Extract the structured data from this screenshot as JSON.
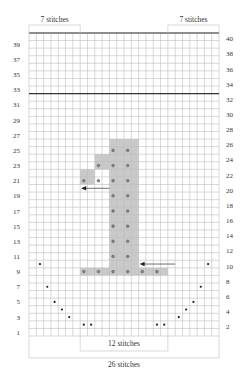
{
  "chart_data": {
    "type": "knitting-chart",
    "grid": {
      "columns": 26,
      "rows": 40,
      "left": 29,
      "top": 33,
      "cell_w": 7.31,
      "cell_h": 7.575
    },
    "colors": {
      "grid": "#bdbdbd",
      "thick_line": "#333333",
      "shade": "#c9c9c9",
      "dot": "#555555",
      "bracket": "#c8c8c8",
      "text": "#333333"
    },
    "thick_lines_after_row": [
      32,
      40
    ],
    "left_row_labels": [
      39,
      37,
      35,
      33,
      31,
      29,
      27,
      25,
      23,
      21,
      19,
      17,
      15,
      13,
      11,
      9,
      7,
      5,
      3,
      1
    ],
    "right_row_labels": [
      40,
      38,
      36,
      34,
      32,
      30,
      28,
      26,
      24,
      22,
      20,
      18,
      16,
      14,
      12,
      10,
      8,
      6,
      4,
      2
    ],
    "shaded_cells": [
      {
        "row_from": 9,
        "row_to": 9,
        "col_from": 8,
        "col_to": 19
      },
      {
        "row_from": 10,
        "row_to": 26,
        "col_from": 12,
        "col_to": 15
      },
      {
        "row_from": 23,
        "row_to": 24,
        "col_from": 10,
        "col_to": 11
      },
      {
        "row_from": 21,
        "row_to": 22,
        "col_from": 8,
        "col_to": 9
      }
    ],
    "ring_dots": [
      {
        "row": 25,
        "cols": [
          12,
          14
        ]
      },
      {
        "row": 23,
        "cols": [
          10,
          12,
          14
        ]
      },
      {
        "row": 21,
        "cols": [
          8,
          10,
          12,
          14
        ]
      },
      {
        "row": 19,
        "cols": [
          12,
          14
        ]
      },
      {
        "row": 17,
        "cols": [
          12,
          14
        ]
      },
      {
        "row": 15,
        "cols": [
          12,
          14
        ]
      },
      {
        "row": 13,
        "cols": [
          12,
          14
        ]
      },
      {
        "row": 11,
        "cols": [
          12,
          14
        ]
      },
      {
        "row": 9,
        "cols": [
          8,
          10,
          12,
          14,
          16,
          18
        ]
      }
    ],
    "small_dots": [
      {
        "row": 10,
        "cols": [
          2,
          25
        ]
      },
      {
        "row": 7,
        "cols": [
          3,
          24
        ]
      },
      {
        "row": 5,
        "cols": [
          4,
          23
        ]
      },
      {
        "row": 4,
        "cols": [
          5,
          22
        ]
      },
      {
        "row": 3,
        "cols": [
          6,
          21
        ]
      },
      {
        "row": 2,
        "cols": [
          8,
          9,
          18,
          19
        ]
      }
    ],
    "arrows": [
      {
        "row": 20,
        "from_col_edge": 12,
        "to_col_edge": 8,
        "direction": "left"
      },
      {
        "row": 10,
        "from_col_edge": 20,
        "to_col_edge": 16,
        "direction": "left"
      }
    ],
    "brackets": [
      {
        "position": "top",
        "col_from": 1,
        "col_to": 7,
        "label": "7 stitches"
      },
      {
        "position": "top",
        "col_from": 20,
        "col_to": 26,
        "label": "7 stitches"
      },
      {
        "position": "bottom",
        "col_from": 8,
        "col_to": 19,
        "label": "12 stitches",
        "depth": 20
      },
      {
        "position": "bottom",
        "col_from": 1,
        "col_to": 26,
        "label": "26 stitches",
        "depth": 30
      }
    ]
  }
}
